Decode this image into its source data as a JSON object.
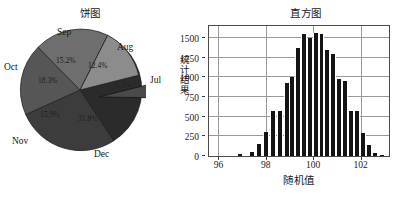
{
  "figure": {
    "width": 413,
    "height": 197,
    "background": "#ffffff"
  },
  "pie": {
    "title": "饼图",
    "labels": [
      "Jul",
      "Aug",
      "Sep",
      "Oct",
      "Nov",
      "Dec"
    ],
    "percent_labels": [
      "6.3%",
      "12.4%",
      "15.2%",
      "18.3%",
      "15.9%",
      "31.8%"
    ],
    "month_jul": "Jul",
    "month_aug": "Aug",
    "month_sep": "Sep",
    "month_oct": "Oct",
    "month_nov": "Nov",
    "month_dec": "Dec",
    "pct_jul": "6.3%",
    "pct_aug": "12.4%",
    "pct_sep": "15.2%",
    "pct_oct": "18.3%",
    "pct_nov": "15.9%",
    "pct_dec": "31.8%"
  },
  "histogram": {
    "title": "直方图",
    "xlabel": "随机值",
    "ylabel_chars": [
      "统",
      "计",
      "结",
      "果"
    ],
    "ylabel": "统计结果",
    "yticks": [
      "0",
      "250",
      "500",
      "750",
      "1000",
      "1250",
      "1500"
    ],
    "xticks": [
      "96",
      "98",
      "100",
      "102"
    ]
  },
  "chart_data": [
    {
      "type": "pie",
      "title": "饼图",
      "categories": [
        "Jul",
        "Aug",
        "Sep",
        "Oct",
        "Nov",
        "Dec"
      ],
      "values": [
        6.3,
        12.4,
        15.2,
        18.3,
        15.9,
        31.8
      ],
      "value_labels": [
        "6.3%",
        "12.4%",
        "15.2%",
        "18.3%",
        "15.9%",
        "31.8%"
      ],
      "units": "percent",
      "exploded_slices": [
        "Jul"
      ],
      "slice_colors": [
        "#4a4a4a",
        "#8c8c8c",
        "#6e6e6e",
        "#565656",
        "#3c3c3c",
        "#2b2b2b"
      ],
      "legend": "none",
      "label_position": "outside-with-inside-percent"
    },
    {
      "type": "bar",
      "subtype": "histogram",
      "title": "直方图",
      "xlabel": "随机值",
      "ylabel": "统计结果",
      "xlim": [
        95.6,
        103.2
      ],
      "ylim": [
        0,
        1650
      ],
      "yticks": [
        0,
        250,
        500,
        750,
        1000,
        1250,
        1500
      ],
      "xticks": [
        96,
        98,
        100,
        102
      ],
      "grid": true,
      "bar_color": "#141414",
      "bin_width": 0.25,
      "x": [
        96.9,
        97.4,
        97.7,
        98.0,
        98.3,
        98.6,
        98.9,
        99.1,
        99.35,
        99.6,
        99.85,
        100.1,
        100.35,
        100.6,
        100.85,
        101.1,
        101.35,
        101.6,
        101.85,
        102.1,
        102.35,
        102.6,
        102.9
      ],
      "values": [
        25,
        55,
        155,
        300,
        575,
        575,
        925,
        1000,
        1370,
        1550,
        1500,
        1560,
        1550,
        1340,
        1300,
        975,
        950,
        575,
        575,
        290,
        145,
        40,
        15
      ],
      "bin_labels": [
        "96.9",
        "97.4",
        "97.7",
        "98.0",
        "98.3",
        "98.6",
        "98.9",
        "99.1",
        "99.35",
        "99.6",
        "99.85",
        "100.1",
        "100.35",
        "100.6",
        "100.85",
        "101.1",
        "101.35",
        "101.6",
        "101.85",
        "102.1",
        "102.35",
        "102.6",
        "102.9"
      ]
    }
  ]
}
